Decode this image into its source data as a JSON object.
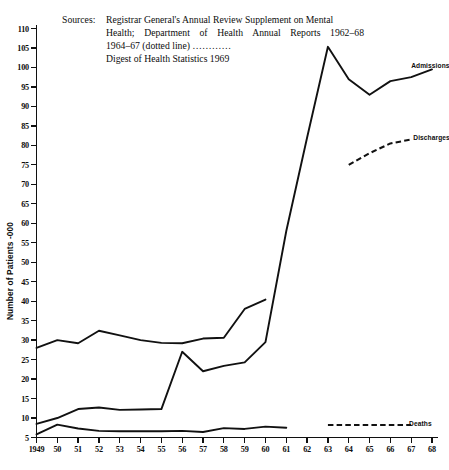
{
  "figure": {
    "sources_label": "Sources:",
    "source_lines": [
      "Registrar General's Annual Review Supplement on Mental",
      "Health; Department of Health Annual Reports 1962–68",
      "1964–67 (dotted line) …………",
      "Digest of Health Statistics 1969"
    ],
    "colors": {
      "ink": "#111111",
      "background": "#ffffff"
    }
  },
  "chart_data": {
    "type": "line",
    "title": "",
    "xlabel": "",
    "ylabel": "Number of Patients -000",
    "xlim": [
      1949,
      1968
    ],
    "ylim": [
      5,
      110
    ],
    "ytick_step": 5,
    "grid": false,
    "legend": "inline-end-labels",
    "ytick_labels": [
      "110",
      "105",
      "100",
      "95",
      "90",
      "85",
      "80",
      "75",
      "70",
      "65",
      "60",
      "55",
      "50",
      "45",
      "40",
      "35",
      "30",
      "25",
      "20",
      "15",
      "10",
      "5"
    ],
    "ytick_values": [
      110,
      105,
      100,
      95,
      90,
      85,
      80,
      75,
      70,
      65,
      60,
      55,
      50,
      45,
      40,
      35,
      30,
      25,
      20,
      15,
      10,
      5
    ],
    "xtick_labels": [
      "1949",
      "50",
      "51",
      "52",
      "53",
      "54",
      "55",
      "56",
      "57",
      "58",
      "59",
      "60",
      "61",
      "62",
      "63",
      "64",
      "65",
      "66",
      "67",
      "68"
    ],
    "x": [
      1949,
      1950,
      1951,
      1952,
      1953,
      1954,
      1955,
      1956,
      1957,
      1958,
      1959,
      1960,
      1961,
      1962,
      1963,
      1964,
      1965,
      1966,
      1967,
      1968
    ],
    "series": [
      {
        "name": "Resident patients",
        "style": "solid",
        "label": "",
        "x": [
          1949,
          1950,
          1951,
          1952,
          1953,
          1954,
          1955,
          1956,
          1957,
          1958,
          1959,
          1960
        ],
        "values": [
          28.0,
          30.0,
          29.2,
          32.4,
          31.2,
          30.0,
          29.3,
          29.2,
          30.4,
          30.6,
          38.0,
          40.4
        ]
      },
      {
        "name": "Admissions",
        "style": "solid",
        "label": "Admissions",
        "x": [
          1949,
          1950,
          1951,
          1952,
          1953,
          1954,
          1955,
          1956,
          1957,
          1958,
          1959,
          1960,
          1961,
          1962,
          1963,
          1964,
          1965,
          1966,
          1967,
          1968
        ],
        "values": [
          8.5,
          10.0,
          12.3,
          12.7,
          12.1,
          12.2,
          12.3,
          27.0,
          22.0,
          23.4,
          24.3,
          29.5,
          58.0,
          82.0,
          105.3,
          97.0,
          93.0,
          96.5,
          97.5,
          99.5
        ]
      },
      {
        "name": "Discharges",
        "style": "dotted",
        "label": "Discharges",
        "x": [
          1964,
          1965,
          1966,
          1967
        ],
        "values": [
          75.0,
          78.0,
          80.5,
          81.5
        ]
      },
      {
        "name": "Deaths",
        "style": "solid",
        "label": "",
        "x": [
          1949,
          1950,
          1951,
          1952,
          1953,
          1954,
          1955,
          1956,
          1957,
          1958,
          1959,
          1960,
          1961
        ],
        "values": [
          5.8,
          8.3,
          7.3,
          6.7,
          6.6,
          6.6,
          6.6,
          6.7,
          6.4,
          7.4,
          7.2,
          7.8,
          7.5
        ]
      },
      {
        "name": "Deaths dotted",
        "style": "dotted",
        "label": "Deaths",
        "x": [
          1963,
          1964,
          1965,
          1966,
          1967
        ],
        "values": [
          8.2,
          8.2,
          8.2,
          8.2,
          8.2
        ]
      }
    ],
    "annotations": [
      {
        "text": "Admissions",
        "x": 1967.0,
        "y": 100.5
      },
      {
        "text": "Discharges",
        "x": 1967.1,
        "y": 82.0
      },
      {
        "text": "Deaths",
        "x": 1966.9,
        "y": 8.4
      }
    ]
  }
}
